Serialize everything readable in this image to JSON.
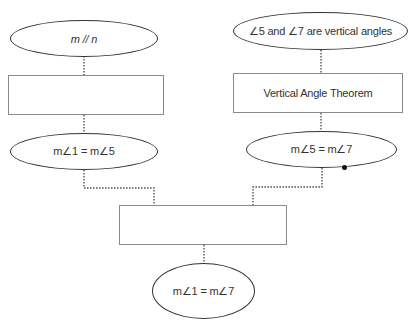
{
  "diagram": {
    "type": "flow-proof",
    "nodes": {
      "left_given": {
        "shape": "ellipse",
        "text": "m // n"
      },
      "left_reason": {
        "shape": "rect",
        "text": ""
      },
      "left_statement": {
        "shape": "ellipse",
        "text": "m∠1 = m∠5"
      },
      "right_given": {
        "shape": "ellipse",
        "text": "∠5 and ∠7 are vertical angles"
      },
      "right_reason": {
        "shape": "rect",
        "text": "Vertical Angle Theorem"
      },
      "right_statement": {
        "shape": "ellipse",
        "text": "m∠5 = m∠7"
      },
      "final_reason": {
        "shape": "rect",
        "text": ""
      },
      "conclusion": {
        "shape": "ellipse",
        "text": "m∠1 = m∠7"
      }
    },
    "edges": [
      [
        "left_given",
        "left_reason"
      ],
      [
        "left_reason",
        "left_statement"
      ],
      [
        "right_given",
        "right_reason"
      ],
      [
        "right_reason",
        "right_statement"
      ],
      [
        "left_statement",
        "final_reason"
      ],
      [
        "right_statement",
        "final_reason"
      ],
      [
        "final_reason",
        "conclusion"
      ]
    ],
    "colors": {
      "stroke": "#333333",
      "rect_border": "#8a8a8a",
      "connector": "#555555"
    }
  }
}
